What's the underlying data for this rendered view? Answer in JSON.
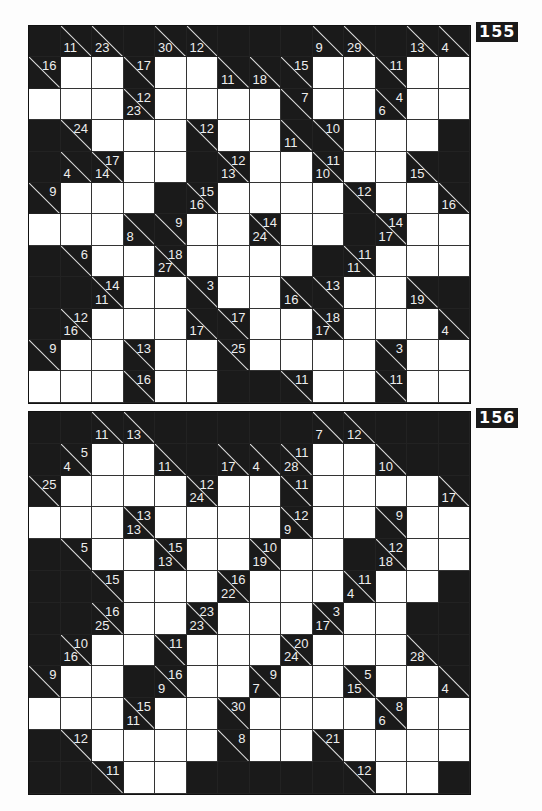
{
  "puzzles": [
    {
      "number": "155",
      "top": 25,
      "row_height": 31.4,
      "rows": [
        [
          "B",
          {
            "d": "11"
          },
          {
            "d": "23"
          },
          "B",
          {
            "d": "30"
          },
          {
            "d": "12"
          },
          "B",
          "B",
          "B",
          {
            "d": "9"
          },
          {
            "d": "29"
          },
          "B",
          {
            "d": "13"
          },
          {
            "d": "4"
          }
        ],
        [
          {
            "r": "16"
          },
          "W",
          "W",
          {
            "r": "17"
          },
          "W",
          "W",
          {
            "d": "11"
          },
          {
            "d": "18"
          },
          {
            "r": "15"
          },
          "W",
          "W",
          {
            "r": "11"
          },
          "W",
          "W"
        ],
        [
          "W",
          "W",
          "W",
          {
            "d": "23",
            "r": "12"
          },
          "W",
          "W",
          "W",
          "W",
          {
            "r": "7"
          },
          "W",
          "W",
          {
            "d": "6",
            "r": "4"
          },
          "W",
          "W"
        ],
        [
          "B",
          {
            "r": "24"
          },
          "W",
          "W",
          "W",
          {
            "r": "12"
          },
          "W",
          "W",
          {
            "d": "11"
          },
          {
            "r": "10"
          },
          "W",
          "W",
          "W",
          "B"
        ],
        [
          "B",
          {
            "d": "4"
          },
          {
            "d": "14",
            "r": "17"
          },
          "W",
          "W",
          "B",
          {
            "d": "13",
            "r": "12"
          },
          "W",
          "W",
          {
            "d": "10",
            "r": "11"
          },
          "W",
          "W",
          {
            "d": "15"
          },
          "B"
        ],
        [
          {
            "r": "9"
          },
          "W",
          "W",
          "W",
          "B",
          {
            "d": "16",
            "r": "15"
          },
          "W",
          "W",
          "W",
          "W",
          {
            "r": "12"
          },
          "W",
          "W",
          {
            "d": "16"
          }
        ],
        [
          "W",
          "W",
          "W",
          {
            "d": "8"
          },
          {
            "r": "9"
          },
          "W",
          "W",
          {
            "d": "24",
            "r": "14"
          },
          "W",
          "W",
          "B",
          {
            "d": "17",
            "r": "14"
          },
          "W",
          "W"
        ],
        [
          "B",
          {
            "r": "6"
          },
          "W",
          "W",
          {
            "d": "27",
            "r": "18"
          },
          "W",
          "W",
          "W",
          "W",
          "B",
          {
            "d": "11",
            "r": "11"
          },
          "W",
          "W",
          "W"
        ],
        [
          "B",
          "B",
          {
            "d": "11",
            "r": "14"
          },
          "W",
          "W",
          {
            "r": "3"
          },
          "W",
          "W",
          {
            "d": "16"
          },
          {
            "r": "13"
          },
          "W",
          "W",
          {
            "d": "19"
          },
          "B"
        ],
        [
          "B",
          {
            "d": "16",
            "r": "12"
          },
          "W",
          "W",
          "W",
          {
            "d": "17"
          },
          {
            "r": "17"
          },
          "W",
          "W",
          {
            "d": "17",
            "r": "18"
          },
          "W",
          "W",
          "W",
          {
            "d": "4"
          }
        ],
        [
          {
            "r": "9"
          },
          "W",
          "W",
          {
            "r": "13"
          },
          "W",
          "W",
          {
            "r": "25"
          },
          "W",
          "W",
          "W",
          "W",
          {
            "r": "3"
          },
          "W",
          "W"
        ],
        [
          "W",
          "W",
          "W",
          {
            "r": "16"
          },
          "W",
          "W",
          "B",
          "B",
          {
            "r": "11"
          },
          "W",
          "W",
          {
            "r": "11"
          },
          "W",
          "W"
        ]
      ]
    },
    {
      "number": "156",
      "top": 411,
      "row_height": 31.8,
      "rows": [
        [
          "B",
          "B",
          {
            "d": "11"
          },
          {
            "d": "13"
          },
          "B",
          "B",
          "B",
          "B",
          "B",
          {
            "d": "7"
          },
          {
            "d": "12"
          },
          "B",
          "B",
          "B"
        ],
        [
          "B",
          {
            "d": "4",
            "r": "5"
          },
          "W",
          "W",
          {
            "d": "11"
          },
          "B",
          {
            "d": "17"
          },
          {
            "d": "4"
          },
          {
            "d": "28",
            "r": "11"
          },
          "W",
          "W",
          {
            "d": "10"
          },
          "B",
          "B"
        ],
        [
          {
            "r": "25"
          },
          "W",
          "W",
          "W",
          "W",
          {
            "d": "24",
            "r": "12"
          },
          "W",
          "W",
          {
            "r": "11"
          },
          "W",
          "W",
          "W",
          "W",
          {
            "d": "17"
          }
        ],
        [
          "W",
          "W",
          "W",
          {
            "d": "13",
            "r": "13"
          },
          "W",
          "W",
          "W",
          "W",
          {
            "d": "9",
            "r": "12"
          },
          "W",
          "W",
          {
            "r": "9"
          },
          "W",
          "W"
        ],
        [
          "B",
          {
            "r": "5"
          },
          "W",
          "W",
          {
            "d": "13",
            "r": "15"
          },
          "W",
          "W",
          {
            "d": "19",
            "r": "10"
          },
          "W",
          "W",
          "B",
          {
            "d": "18",
            "r": "12"
          },
          "W",
          "W"
        ],
        [
          "B",
          "B",
          {
            "r": "15"
          },
          "W",
          "W",
          "W",
          {
            "d": "22",
            "r": "16"
          },
          "W",
          "W",
          "W",
          {
            "d": "4",
            "r": "11"
          },
          "W",
          "W",
          "B"
        ],
        [
          "B",
          "B",
          {
            "d": "25",
            "r": "16"
          },
          "W",
          "W",
          {
            "d": "23",
            "r": "23"
          },
          "W",
          "W",
          "W",
          {
            "d": "17",
            "r": "3"
          },
          "W",
          "W",
          "B",
          "B"
        ],
        [
          "B",
          {
            "d": "16",
            "r": "10"
          },
          "W",
          "W",
          {
            "r": "11"
          },
          "W",
          "W",
          "W",
          {
            "d": "24",
            "r": "20"
          },
          "W",
          "W",
          "W",
          {
            "d": "28"
          },
          "B"
        ],
        [
          {
            "r": "9"
          },
          "W",
          "W",
          "B",
          {
            "d": "9",
            "r": "16"
          },
          "W",
          "W",
          {
            "d": "7",
            "r": "9"
          },
          "W",
          "W",
          {
            "d": "15",
            "r": "5"
          },
          "W",
          "W",
          {
            "d": "4"
          }
        ],
        [
          "W",
          "W",
          "W",
          {
            "d": "11",
            "r": "15"
          },
          "W",
          "W",
          {
            "r": "30"
          },
          "W",
          "W",
          "W",
          "W",
          {
            "d": "6",
            "r": "8"
          },
          "W",
          "W"
        ],
        [
          "B",
          {
            "r": "12"
          },
          "W",
          "W",
          "W",
          "W",
          {
            "r": "8"
          },
          "W",
          "W",
          {
            "r": "21"
          },
          "W",
          "W",
          "W",
          "W"
        ],
        [
          "B",
          "B",
          {
            "r": "11"
          },
          "W",
          "W",
          "B",
          "B",
          "B",
          "B",
          "B",
          {
            "r": "12"
          },
          "W",
          "W",
          "B"
        ]
      ]
    }
  ]
}
